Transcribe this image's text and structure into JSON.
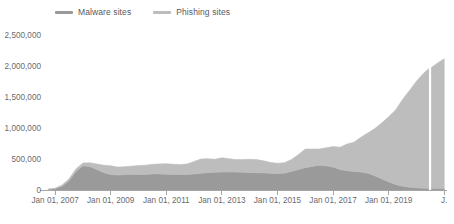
{
  "chart_data": {
    "type": "area",
    "stacked": true,
    "title": "",
    "subtitle": "",
    "xlabel": "",
    "ylabel": "",
    "grid": false,
    "legend_position": "top-left",
    "ylim": [
      0,
      2500000
    ],
    "ytick_labels": [
      "0",
      "500,000",
      "1,000,000",
      "1,500,000",
      "2,000,000",
      "2,500,000"
    ],
    "ytick_values": [
      0,
      500000,
      1000000,
      1500000,
      2000000,
      2500000
    ],
    "xtick_labels": [
      "Jan 01, 2007",
      "Jan 01, 2009",
      "Jan 01, 2011",
      "Jan 01, 2013",
      "Jan 01, 2015",
      "Jan 01, 2017",
      "Jan 01, 2019",
      "J."
    ],
    "xtick_x": [
      2007.0,
      2009.0,
      2011.0,
      2013.0,
      2015.0,
      2017.0,
      2019.0,
      2021.0
    ],
    "xlim": [
      2006.6,
      2021.1
    ],
    "colors": {
      "malware": "#9a9a9a",
      "phishing": "#bdbdbd",
      "axis": "#a6a6a6",
      "text": "#6b6b6e"
    },
    "data_gap": {
      "x": 2020.45,
      "width": 0.08
    },
    "x": [
      2006.75,
      2007.0,
      2007.25,
      2007.5,
      2007.75,
      2008.0,
      2008.25,
      2008.5,
      2008.75,
      2009.0,
      2009.25,
      2009.5,
      2009.75,
      2010.0,
      2010.25,
      2010.5,
      2010.75,
      2011.0,
      2011.25,
      2011.5,
      2011.75,
      2012.0,
      2012.25,
      2012.5,
      2012.75,
      2013.0,
      2013.25,
      2013.5,
      2013.75,
      2014.0,
      2014.25,
      2014.5,
      2014.75,
      2015.0,
      2015.25,
      2015.5,
      2015.75,
      2016.0,
      2016.25,
      2016.5,
      2016.75,
      2017.0,
      2017.25,
      2017.5,
      2017.75,
      2018.0,
      2018.25,
      2018.5,
      2018.75,
      2019.0,
      2019.25,
      2019.5,
      2019.75,
      2020.0,
      2020.25,
      2020.45,
      2020.55,
      2020.75,
      2021.0
    ],
    "series": [
      {
        "name": "Malware sites",
        "color": "#9a9a9a",
        "values": [
          10000,
          20000,
          60000,
          150000,
          300000,
          390000,
          380000,
          330000,
          280000,
          250000,
          240000,
          250000,
          255000,
          250000,
          250000,
          260000,
          260000,
          255000,
          250000,
          250000,
          250000,
          260000,
          270000,
          280000,
          285000,
          290000,
          290000,
          290000,
          285000,
          280000,
          280000,
          275000,
          270000,
          265000,
          270000,
          300000,
          330000,
          360000,
          380000,
          400000,
          390000,
          370000,
          330000,
          310000,
          300000,
          290000,
          270000,
          230000,
          180000,
          130000,
          90000,
          60000,
          45000,
          35000,
          30000,
          28000,
          28000,
          26000,
          25000
        ]
      },
      {
        "name": "Phishing sites",
        "color": "#bdbdbd",
        "values": [
          5000,
          10000,
          20000,
          30000,
          40000,
          45000,
          60000,
          90000,
          120000,
          140000,
          130000,
          125000,
          130000,
          145000,
          150000,
          155000,
          160000,
          170000,
          165000,
          160000,
          170000,
          200000,
          230000,
          225000,
          210000,
          230000,
          215000,
          200000,
          205000,
          215000,
          210000,
          195000,
          175000,
          165000,
          170000,
          190000,
          240000,
          300000,
          280000,
          260000,
          290000,
          330000,
          360000,
          430000,
          470000,
          560000,
          650000,
          760000,
          900000,
          1050000,
          1200000,
          1400000,
          1560000,
          1720000,
          1850000,
          1930000,
          1950000,
          2020000,
          2090000
        ]
      }
    ]
  },
  "legend": {
    "items": [
      {
        "label": "Malware sites",
        "color": "#9a9a9a"
      },
      {
        "label": "Phishing sites",
        "color": "#bdbdbd"
      }
    ]
  }
}
